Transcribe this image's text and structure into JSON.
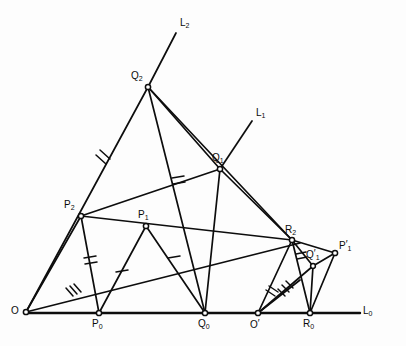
{
  "figure": {
    "ink_color": "#0d0d0d",
    "background": "#fdfdfd",
    "line_width": 1.6,
    "vertex_marker": "small open circle",
    "lines": [
      {
        "name": "L0",
        "label": "L",
        "sub": "0",
        "kind": "baseline-horizontal"
      },
      {
        "name": "L1",
        "label": "L",
        "sub": "1",
        "kind": "ray-through-Q1"
      },
      {
        "name": "L2",
        "label": "L",
        "sub": "2",
        "kind": "ray-through-Q2"
      }
    ],
    "points": [
      {
        "name": "O",
        "label": "O",
        "sub": "",
        "prime": ""
      },
      {
        "name": "P0",
        "label": "P",
        "sub": "0",
        "prime": ""
      },
      {
        "name": "Q0",
        "label": "Q",
        "sub": "0",
        "prime": ""
      },
      {
        "name": "Oprime",
        "label": "O",
        "sub": "",
        "prime": "′"
      },
      {
        "name": "R0",
        "label": "R",
        "sub": "0",
        "prime": ""
      },
      {
        "name": "P2",
        "label": "P",
        "sub": "2",
        "prime": ""
      },
      {
        "name": "P1",
        "label": "P",
        "sub": "1",
        "prime": ""
      },
      {
        "name": "Q2",
        "label": "Q",
        "sub": "2",
        "prime": ""
      },
      {
        "name": "Q1",
        "label": "Q",
        "sub": "1",
        "prime": ""
      },
      {
        "name": "R2",
        "label": "R",
        "sub": "2",
        "prime": ""
      },
      {
        "name": "Q1prime",
        "label": "Q",
        "sub": "1",
        "prime": "′"
      },
      {
        "name": "P1prime",
        "label": "P",
        "sub": "1",
        "prime": "′"
      }
    ],
    "tick_marks": [
      {
        "on": "O-Q2",
        "count": 2
      },
      {
        "on": "Q2-Q0",
        "count": 2
      },
      {
        "on": "P2-P0",
        "count": 2
      },
      {
        "on": "O-P1",
        "count": 3
      },
      {
        "on": "P0-P1",
        "count": 1
      },
      {
        "on": "P1-Q0",
        "count": 1
      },
      {
        "on": "Oprime-R2",
        "count": 2
      },
      {
        "on": "Oprime-Q1prime",
        "count": 3
      },
      {
        "on": "R2-Q1prime",
        "count": 2
      }
    ]
  },
  "labels": {
    "L0": "L",
    "L0_sub": "0",
    "L1": "L",
    "L1_sub": "1",
    "L2": "L",
    "L2_sub": "2",
    "O": "O",
    "P0": "P",
    "P0_sub": "0",
    "Q0": "Q",
    "Q0_sub": "0",
    "Oprime": "O",
    "Oprime_mark": "′",
    "R0": "R",
    "R0_sub": "0",
    "P2": "P",
    "P2_sub": "2",
    "P1": "P",
    "P1_sub": "1",
    "Q2": "Q",
    "Q2_sub": "2",
    "Q1": "Q",
    "Q1_sub": "1",
    "R2": "R",
    "R2_sub": "2",
    "Q1prime": "Q",
    "Q1prime_sub": "1",
    "Q1prime_mark": "′",
    "P1prime": "P",
    "P1prime_sub": "1",
    "P1prime_mark": "′"
  }
}
